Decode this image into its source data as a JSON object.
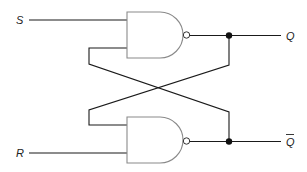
{
  "diagram": {
    "type": "logic-circuit",
    "colors": {
      "wire": "#1a1a1a",
      "gate_outline": "#8a8a8a",
      "background": "#ffffff"
    },
    "inputs": [
      {
        "label": "S",
        "y": 20
      },
      {
        "label": "R",
        "y": 153
      }
    ],
    "outputs": [
      {
        "label": "Q",
        "y": 36
      },
      {
        "label": "Q",
        "overline": true,
        "y": 142
      }
    ],
    "gates": [
      {
        "name": "top-nand-gate",
        "kind": "NAND"
      },
      {
        "name": "bottom-nand-gate",
        "kind": "NAND"
      }
    ],
    "connections": [
      "S -> top NAND input 1",
      "bottom NAND output -> top NAND input 2",
      "R -> bottom NAND input 2",
      "top NAND output -> bottom NAND input 1",
      "top NAND output -> Q",
      "bottom NAND output -> Q-bar"
    ]
  }
}
